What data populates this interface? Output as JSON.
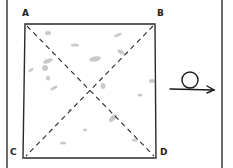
{
  "diagram": {
    "type": "folding-square",
    "corners": [
      {
        "label": "A",
        "x": 22,
        "y": 9
      },
      {
        "label": "B",
        "x": 157,
        "y": 9
      },
      {
        "label": "C",
        "x": 10,
        "y": 148
      },
      {
        "label": "D",
        "x": 160,
        "y": 148
      }
    ],
    "square": {
      "tl": [
        25,
        24
      ],
      "tr": [
        155,
        24
      ],
      "bl": [
        23,
        158
      ],
      "br": [
        156,
        158
      ]
    },
    "diagonals": [
      "A-D",
      "B-C"
    ],
    "diagonal_style": "dashed",
    "symbol": "loop-arrow",
    "colors": {
      "stroke": "#2a2a2a",
      "frame": "#6b6b6b",
      "texture": "#b5b5b5",
      "background": "#ffffff"
    }
  }
}
